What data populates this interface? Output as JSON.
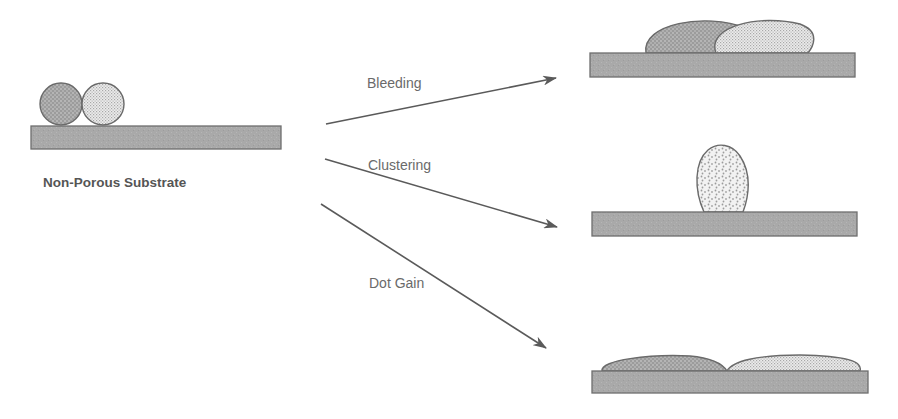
{
  "diagram": {
    "source": {
      "caption": "Non-Porous Substrate",
      "droplets": 2
    },
    "transitions": [
      {
        "label": "Bleeding",
        "result": "two droplets spread and merge into overlapping flattened ellipses"
      },
      {
        "label": "Clustering",
        "result": "droplets coalesce into a single tall oval droplet"
      },
      {
        "label": "Dot Gain",
        "result": "droplets spread into two thin flat lenses across the substrate"
      }
    ],
    "colors": {
      "substrate_fill": "#a9a9a9",
      "substrate_stroke": "#6e6e6e",
      "droplet_stroke": "#6a6a6a",
      "arrow": "#5a5a5a",
      "label_text": "#6a6a6a",
      "caption_text": "#555555",
      "background": "#ffffff"
    }
  }
}
